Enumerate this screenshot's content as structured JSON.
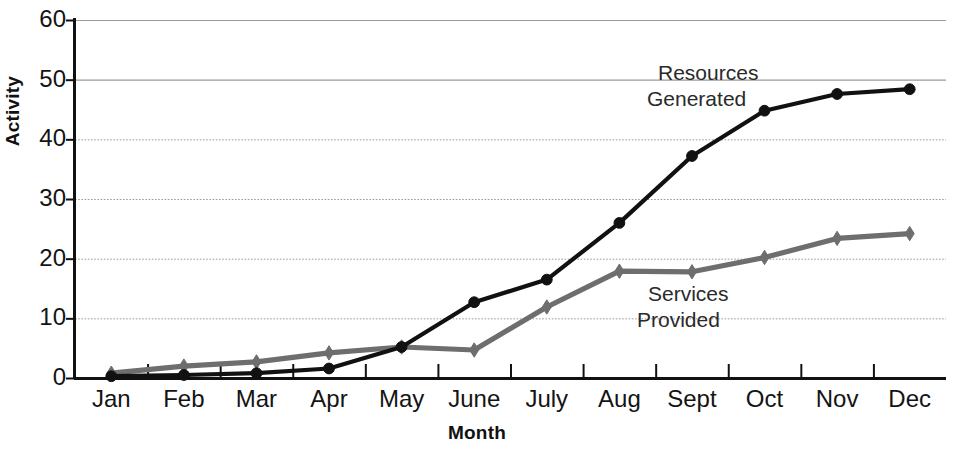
{
  "chart_data": {
    "type": "line",
    "title": "",
    "xlabel": "Month",
    "ylabel": "Activity",
    "categories": [
      "Jan",
      "Feb",
      "Mar",
      "Apr",
      "May",
      "June",
      "July",
      "Aug",
      "Sept",
      "Oct",
      "Nov",
      "Dec"
    ],
    "ylim": [
      0,
      60
    ],
    "yticks": [
      0,
      10,
      20,
      30,
      40,
      50,
      60
    ],
    "grid": "horizontal",
    "legend_position": "inline-annotation",
    "series": [
      {
        "name": "Resources Generated",
        "color": "#111111",
        "marker": "circle",
        "values": [
          0.3,
          0.5,
          0.8,
          1.6,
          5.2,
          12.7,
          16.5,
          26.0,
          37.2,
          44.8,
          47.6,
          48.4
        ]
      },
      {
        "name": "Services Provided",
        "color": "#6e6e6e",
        "marker": "diamond",
        "values": [
          0.8,
          2.0,
          2.7,
          4.2,
          5.2,
          4.7,
          11.9,
          17.9,
          17.8,
          20.2,
          23.4,
          24.2
        ]
      }
    ],
    "annotations": [
      {
        "id": "resources",
        "line1": "Resources",
        "line2": "Generated"
      },
      {
        "id": "services",
        "line1": "Services",
        "line2": "Provided"
      }
    ]
  },
  "axis": {
    "y_title": "Activity",
    "x_title": "Month"
  },
  "colors": {
    "axis": "#111111",
    "grid": "#9a9a9a",
    "series_primary": "#111111",
    "series_secondary": "#6e6e6e",
    "background": "#ffffff"
  }
}
